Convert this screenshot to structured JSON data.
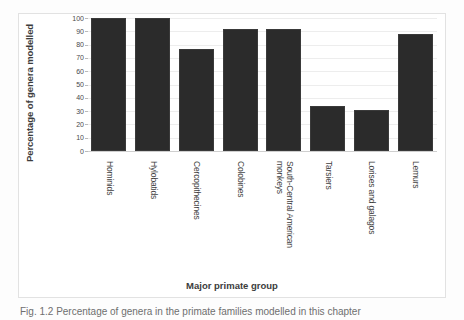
{
  "figure": {
    "caption_partial": "Fig. 1.2  Percentage of genera in the primate families modelled in this chapter"
  },
  "chart_data": {
    "type": "bar",
    "title": "",
    "xlabel": "Major primate group",
    "ylabel": "Percentage of genera modelled",
    "ylim": [
      0,
      100
    ],
    "yticks": [
      0,
      10,
      20,
      30,
      40,
      50,
      60,
      70,
      80,
      90,
      100
    ],
    "ytick_labels": [
      "0",
      "10",
      "20",
      "30",
      "40",
      "50",
      "60",
      "70",
      "80",
      "90",
      "100"
    ],
    "grid": true,
    "legend": false,
    "bar_color": "#2b2b2b",
    "categories": [
      "Hominids",
      "Hylobatids",
      "Cercopithecines",
      "Colobines",
      "South-Central American\nmonkeys",
      "Tarsiers",
      "Lorises and galagos",
      "Lemurs"
    ],
    "values": [
      100,
      100,
      77,
      92,
      92,
      34,
      31,
      88
    ]
  }
}
